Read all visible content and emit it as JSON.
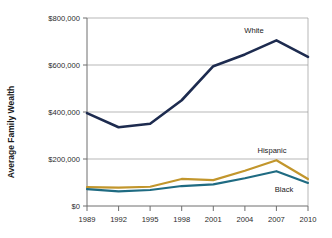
{
  "chart_data": {
    "type": "line",
    "title": "",
    "xlabel": "",
    "ylabel": "Average Family Wealth",
    "x": [
      1989,
      1992,
      1995,
      1998,
      2001,
      2004,
      2007,
      2010
    ],
    "xtick_labels": [
      "1989",
      "1992",
      "1995",
      "1998",
      "2001",
      "2004",
      "2007",
      "2010"
    ],
    "ytick_labels": [
      "$0",
      "$200,000",
      "$400,000",
      "$600,000",
      "$800,000"
    ],
    "ytick_values": [
      0,
      200000,
      400000,
      600000,
      800000
    ],
    "ylim": [
      0,
      800000
    ],
    "xlim": [
      1989,
      2010
    ],
    "grid": "horizontal",
    "legend_position": "inline-annotations",
    "series": [
      {
        "name": "White",
        "color": "#1d2b4f",
        "values": [
          395000,
          335000,
          350000,
          450000,
          595000,
          645000,
          705000,
          635000
        ],
        "label": "White"
      },
      {
        "name": "Hispanic",
        "color": "#c2962c",
        "values": [
          80000,
          78000,
          82000,
          115000,
          110000,
          150000,
          195000,
          115000
        ],
        "label": "Hispanic"
      },
      {
        "name": "Black",
        "color": "#1f6b82",
        "values": [
          72000,
          62000,
          68000,
          85000,
          92000,
          118000,
          148000,
          98000
        ],
        "label": "Black"
      }
    ],
    "annotations": [
      {
        "text": "White",
        "series": "White"
      },
      {
        "text": "Hispanic",
        "series": "Hispanic"
      },
      {
        "text": "Black",
        "series": "Black"
      }
    ]
  },
  "axes": {
    "y_axis_title": "Average Family Wealth",
    "y_ticks": [
      "$800,000",
      "$600,000",
      "$400,000",
      "$200,000",
      "$0"
    ],
    "x_ticks": [
      "1989",
      "1992",
      "1995",
      "1998",
      "2001",
      "2004",
      "2007",
      "2010"
    ]
  },
  "labels": {
    "white": "White",
    "hispanic": "Hispanic",
    "black": "Black"
  },
  "colors": {
    "white_line": "#1d2b4f",
    "hispanic_line": "#c2962c",
    "black_line": "#1f6b82",
    "grid": "#9a9a9a",
    "axis": "#6e6e6e",
    "text": "#1a1a1a"
  }
}
